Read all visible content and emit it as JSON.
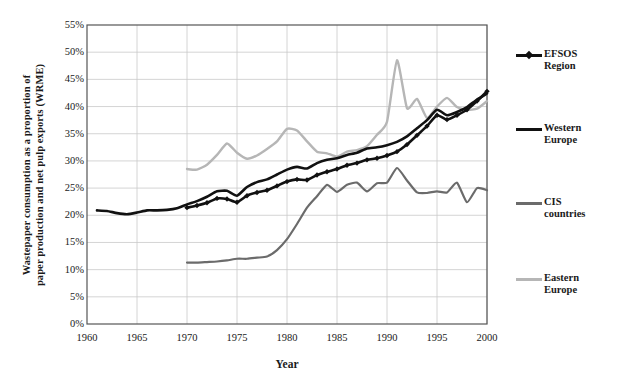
{
  "chart_data": {
    "type": "line",
    "title": "",
    "xlabel": "Year",
    "ylabel_line1": "Wastepaper consumption as a proportion of",
    "ylabel_line2": "paper production and net pulp exports (WRME)",
    "xlim": [
      1960,
      2000
    ],
    "ylim": [
      0,
      55
    ],
    "grid": true,
    "legend_position": "right",
    "ytick_labels": [
      "0%",
      "5%",
      "10%",
      "15%",
      "20%",
      "25%",
      "30%",
      "35%",
      "40%",
      "45%",
      "50%",
      "55%"
    ],
    "ytick_values": [
      0,
      5,
      10,
      15,
      20,
      25,
      30,
      35,
      40,
      45,
      50,
      55
    ],
    "xtick_labels": [
      "1960",
      "1965",
      "1970",
      "1975",
      "1980",
      "1985",
      "1990",
      "1995",
      "2000"
    ],
    "xtick_values": [
      1960,
      1965,
      1970,
      1975,
      1980,
      1985,
      1990,
      1995,
      2000
    ],
    "yunit": "%",
    "series": [
      {
        "name": "EFSOS Region",
        "color": "#111111",
        "marker": "diamond",
        "width": 2.6,
        "x": [
          1970,
          1971,
          1972,
          1973,
          1974,
          1975,
          1976,
          1977,
          1978,
          1979,
          1980,
          1981,
          1982,
          1983,
          1984,
          1985,
          1986,
          1987,
          1988,
          1989,
          1990,
          1991,
          1992,
          1993,
          1994,
          1995,
          1996,
          1997,
          1998,
          1999,
          2000
        ],
        "values": [
          21.4,
          21.8,
          22.3,
          23.1,
          23.0,
          22.4,
          23.6,
          24.2,
          24.6,
          25.4,
          26.2,
          26.6,
          26.5,
          27.4,
          28.0,
          28.5,
          29.2,
          29.6,
          30.2,
          30.5,
          31.0,
          31.7,
          33.0,
          34.7,
          36.4,
          38.4,
          37.6,
          38.4,
          39.4,
          41.0,
          42.8
        ]
      },
      {
        "name": "Western Europe",
        "color": "#111111",
        "marker": "none",
        "width": 2.6,
        "x": [
          1961,
          1962,
          1963,
          1964,
          1965,
          1966,
          1967,
          1968,
          1969,
          1970,
          1971,
          1972,
          1973,
          1974,
          1975,
          1976,
          1977,
          1978,
          1979,
          1980,
          1981,
          1982,
          1983,
          1984,
          1985,
          1986,
          1987,
          1988,
          1989,
          1990,
          1991,
          1992,
          1993,
          1994,
          1995,
          1996,
          1997,
          1998,
          1999,
          2000
        ],
        "values": [
          20.9,
          20.8,
          20.4,
          20.2,
          20.5,
          20.9,
          20.9,
          21.0,
          21.3,
          22.0,
          22.6,
          23.4,
          24.4,
          24.5,
          23.6,
          25.2,
          26.1,
          26.6,
          27.5,
          28.4,
          28.9,
          28.6,
          29.6,
          30.2,
          30.5,
          31.1,
          31.5,
          32.3,
          32.5,
          32.9,
          33.5,
          34.5,
          36.0,
          37.5,
          39.4,
          38.4,
          39.0,
          39.9,
          41.3,
          42.4
        ]
      },
      {
        "name": "CIS countries",
        "color": "#6b6b6b",
        "marker": "none",
        "width": 2.2,
        "x": [
          1970,
          1971,
          1972,
          1973,
          1974,
          1975,
          1976,
          1977,
          1978,
          1979,
          1980,
          1981,
          1982,
          1983,
          1984,
          1985,
          1986,
          1987,
          1988,
          1989,
          1990,
          1991,
          1992,
          1993,
          1994,
          1995,
          1996,
          1997,
          1998,
          1999,
          2000
        ],
        "values": [
          11.3,
          11.3,
          11.4,
          11.5,
          11.7,
          12.0,
          12.0,
          12.2,
          12.4,
          13.6,
          15.6,
          18.4,
          21.4,
          23.5,
          25.6,
          24.3,
          25.6,
          26.0,
          24.4,
          25.9,
          26.0,
          28.7,
          26.4,
          24.2,
          24.1,
          24.4,
          24.2,
          26.0,
          22.4,
          25.0,
          24.6
        ]
      },
      {
        "name": "Eastern Europe",
        "color": "#b6b6b6",
        "marker": "none",
        "width": 2.4,
        "x": [
          1970,
          1971,
          1972,
          1973,
          1974,
          1975,
          1976,
          1977,
          1978,
          1979,
          1980,
          1981,
          1982,
          1983,
          1984,
          1985,
          1986,
          1987,
          1988,
          1989,
          1990,
          1991,
          1992,
          1993,
          1994,
          1995,
          1996,
          1997,
          1998,
          1999,
          2000
        ],
        "values": [
          28.5,
          28.4,
          29.3,
          31.1,
          33.2,
          31.5,
          30.4,
          31.0,
          32.2,
          33.6,
          35.9,
          35.6,
          33.6,
          31.7,
          31.4,
          30.8,
          31.7,
          32.0,
          32.7,
          34.8,
          37.2,
          48.5,
          39.7,
          41.4,
          37.9,
          40.0,
          41.6,
          39.9,
          39.4,
          39.6,
          41.0
        ]
      }
    ]
  },
  "legend": {
    "items": [
      {
        "label_line1": "EFSOS",
        "label_line2": "Region"
      },
      {
        "label_line1": "Western",
        "label_line2": "Europe"
      },
      {
        "label_line1": "CIS",
        "label_line2": "countries"
      },
      {
        "label_line1": "Eastern",
        "label_line2": "Europe"
      }
    ]
  }
}
